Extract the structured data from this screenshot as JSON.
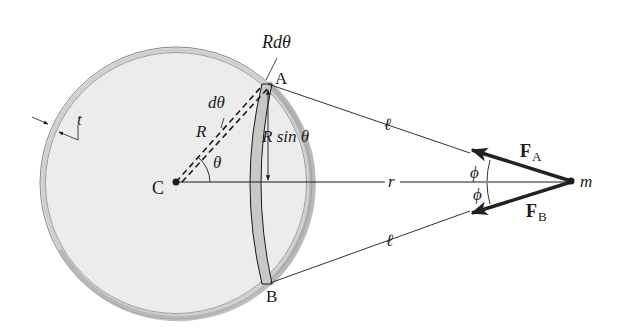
{
  "diagram": {
    "labels": {
      "center": "C",
      "point_a": "A",
      "point_b": "B",
      "mass": "m",
      "arc_length": "Rdθ",
      "d_theta": "dθ",
      "radius": "R",
      "theta": "θ",
      "r_sin_theta": "R sin θ",
      "thickness": "t",
      "distance_r": "r",
      "ell_top": "ℓ",
      "ell_bottom": "ℓ",
      "phi_top": "ϕ",
      "phi_bottom": "ϕ",
      "force_a_main": "F",
      "force_a_sub": "A",
      "force_b_main": "F",
      "force_b_sub": "B"
    },
    "colors": {
      "shell_fill": "#ececec",
      "shell_rim": "#9a9a9a",
      "ring_band": "#c8c8c8",
      "line": "#1a1a1a",
      "force_vector": "#222222"
    }
  }
}
